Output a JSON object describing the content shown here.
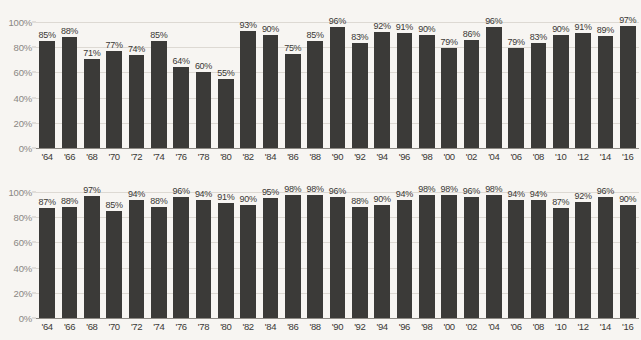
{
  "figure": {
    "background_color": "#f7f5f2",
    "bar_color": "#3b3a38",
    "grid_color": "#ddd9d3",
    "axis_text_color": "#8a8782"
  },
  "chart_data": [
    {
      "type": "bar",
      "title": "",
      "xlabel": "",
      "ylabel": "",
      "ylim": [
        0,
        100
      ],
      "yticks": [
        0,
        20,
        40,
        60,
        80,
        100
      ],
      "ytick_labels": [
        "0%",
        "20%",
        "40%",
        "60%",
        "80%",
        "100%"
      ],
      "grid": true,
      "legend": "none",
      "categories": [
        "'64",
        "'66",
        "'68",
        "'70",
        "'72",
        "'74",
        "'76",
        "'78",
        "'80",
        "'82",
        "'84",
        "'86",
        "'88",
        "'90",
        "'92",
        "'94",
        "'96",
        "'98",
        "'00",
        "'02",
        "'04",
        "'06",
        "'08",
        "'10",
        "'12",
        "'14",
        "'16"
      ],
      "values": [
        85,
        88,
        71,
        77,
        74,
        85,
        64,
        60,
        55,
        93,
        90,
        75,
        85,
        96,
        83,
        92,
        91,
        90,
        79,
        86,
        96,
        79,
        83,
        90,
        91,
        89,
        97
      ],
      "value_labels": [
        "85%",
        "88%",
        "71%",
        "77%",
        "74%",
        "85%",
        "64%",
        "60%",
        "55%",
        "93%",
        "90%",
        "75%",
        "85%",
        "96%",
        "83%",
        "92%",
        "91%",
        "90%",
        "79%",
        "86%",
        "96%",
        "79%",
        "83%",
        "90%",
        "91%",
        "89%",
        "97%"
      ]
    },
    {
      "type": "bar",
      "title": "",
      "xlabel": "",
      "ylabel": "",
      "ylim": [
        0,
        100
      ],
      "yticks": [
        0,
        20,
        40,
        60,
        80,
        100
      ],
      "ytick_labels": [
        "0%",
        "20%",
        "40%",
        "60%",
        "80%",
        "100%"
      ],
      "grid": true,
      "legend": "none",
      "categories": [
        "'64",
        "'66",
        "'68",
        "'70",
        "'72",
        "'74",
        "'76",
        "'78",
        "'80",
        "'82",
        "'84",
        "'86",
        "'88",
        "'90",
        "'92",
        "'94",
        "'96",
        "'98",
        "'00",
        "'02",
        "'04",
        "'06",
        "'08",
        "'10",
        "'12",
        "'14",
        "'16"
      ],
      "values": [
        87,
        88,
        97,
        85,
        94,
        88,
        96,
        94,
        91,
        90,
        95,
        98,
        98,
        96,
        88,
        90,
        94,
        98,
        98,
        96,
        98,
        94,
        94,
        87,
        92,
        96,
        90
      ],
      "value_labels": [
        "87%",
        "88%",
        "97%",
        "85%",
        "94%",
        "88%",
        "96%",
        "94%",
        "91%",
        "90%",
        "95%",
        "98%",
        "98%",
        "96%",
        "88%",
        "90%",
        "94%",
        "98%",
        "98%",
        "96%",
        "98%",
        "94%",
        "94%",
        "87%",
        "92%",
        "96%",
        "90%"
      ]
    }
  ]
}
